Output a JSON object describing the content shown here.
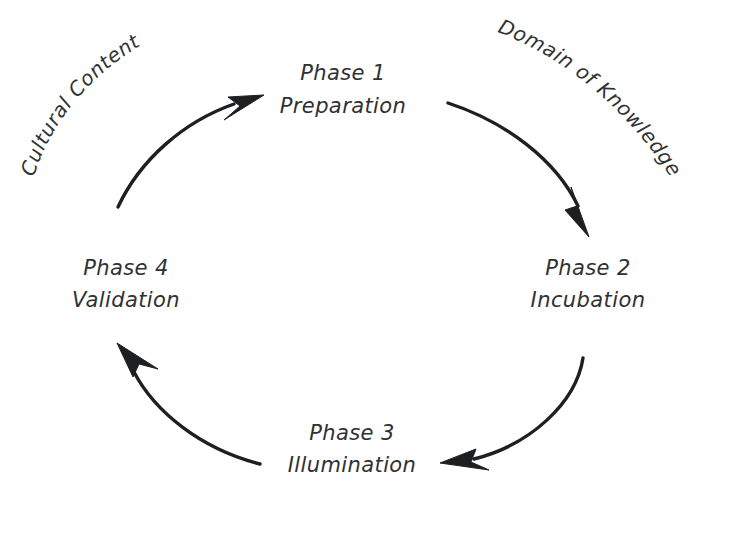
{
  "diagram": {
    "background_color": "#ffffff",
    "stroke_color": "#1d1f21",
    "text_color": "#2f3133",
    "nodes": [
      {
        "id": "phase-1",
        "heading": "Phase 1",
        "subheading": "Preparation",
        "position": "top"
      },
      {
        "id": "phase-2",
        "heading": "Phase 2",
        "subheading": "Incubation",
        "position": "right"
      },
      {
        "id": "phase-3",
        "heading": "Phase 3",
        "subheading": "Illumination",
        "position": "bottom"
      },
      {
        "id": "phase-4",
        "heading": "Phase 4",
        "subheading": "Validation",
        "position": "left"
      }
    ],
    "edge_labels": [
      {
        "id": "cultural-content",
        "text": "Cultural Content",
        "from": "phase-4",
        "to": "phase-1",
        "placement": "outer-upper-left"
      },
      {
        "id": "domain-of-knowledge",
        "text": "Domain of Knowledge",
        "from": "phase-1",
        "to": "phase-2",
        "placement": "outer-upper-right"
      }
    ],
    "edges": [
      {
        "id": "edge-4-to-1",
        "from": "phase-4",
        "to": "phase-1",
        "direction": "clockwise"
      },
      {
        "id": "edge-1-to-2",
        "from": "phase-1",
        "to": "phase-2",
        "direction": "clockwise"
      },
      {
        "id": "edge-2-to-3",
        "from": "phase-2",
        "to": "phase-3",
        "direction": "clockwise"
      },
      {
        "id": "edge-3-to-4",
        "from": "phase-3",
        "to": "phase-4",
        "direction": "clockwise"
      }
    ]
  }
}
